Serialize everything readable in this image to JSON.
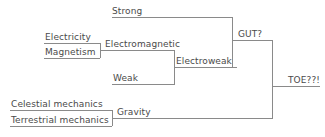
{
  "diagram": {
    "type": "tree-diagram",
    "stroke_color": "#8a8a8a",
    "text_color": "#4a4a4a",
    "background_color": "#ffffff",
    "nodes": {
      "strong": "Strong",
      "electricity": "Electricity",
      "magnetism": "Magnetism",
      "electromagnetic": "Electromagnetic",
      "weak": "Weak",
      "electroweak": "Electroweak",
      "gut": "GUT?",
      "celestial_mechanics": "Celestial mechanics",
      "terrestrial_mechanics": "Terrestrial mechanics",
      "gravity": "Gravity",
      "toe": "TOE??!"
    }
  }
}
